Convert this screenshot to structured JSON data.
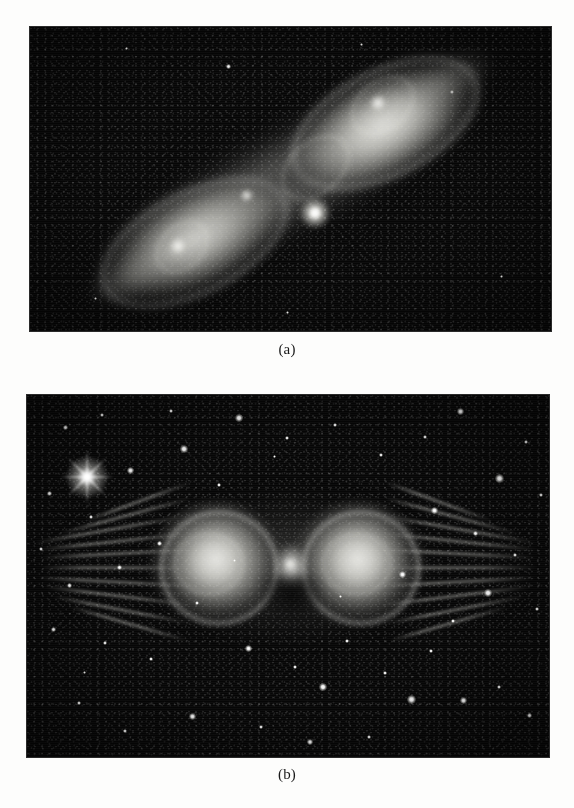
{
  "page": {
    "background_color": "#fdfdfc",
    "text_color": "#1a1a1a",
    "width": 574,
    "height": 808
  },
  "figure": {
    "type": "two-panel astronomical image plate",
    "panels": [
      {
        "id": "a",
        "caption": "(a)",
        "alt": "Grayscale astronomical image of an elongated bipolar nebula tilted diagonally from lower-left to upper-right, with a bright central star at the pinched waist and two glowing lobes on a dark, grainy sky background.",
        "frame": {
          "x": 30,
          "y": 27,
          "width": 521,
          "height": 304
        },
        "background_color": "#070707",
        "nebula_color": "#e4e4de",
        "orientation_degrees": -27,
        "features": [
          "bright central star",
          "upper-right lobe",
          "lower-left lobe",
          "tapered diffuse tips",
          "dark pinched waist lane",
          "internal bright knots",
          "faint field stars"
        ]
      },
      {
        "id": "b",
        "caption": "(b)",
        "alt": "Grayscale astronomical image of a symmetric butterfly-shaped bipolar nebula with two bright lobes joined at a narrow waist, long horizontal filamentary streaks radiating left and right, set in a dense star field; a bright star with diffraction spikes sits in the upper left.",
        "frame": {
          "x": 27,
          "y": 395,
          "width": 522,
          "height": 362
        },
        "background_color": "#070707",
        "nebula_color": "#efefe9",
        "orientation_degrees": 0,
        "features": [
          "twin bright lobes",
          "narrow bright waist",
          "dark V-shaped notch below waist",
          "radiating horizontal filaments",
          "bright star with diffraction spikes",
          "dense field of stars"
        ]
      }
    ]
  },
  "chart_data": {
    "type": "image-plate",
    "title": "",
    "panels": [
      "(a)",
      "(b)"
    ]
  }
}
